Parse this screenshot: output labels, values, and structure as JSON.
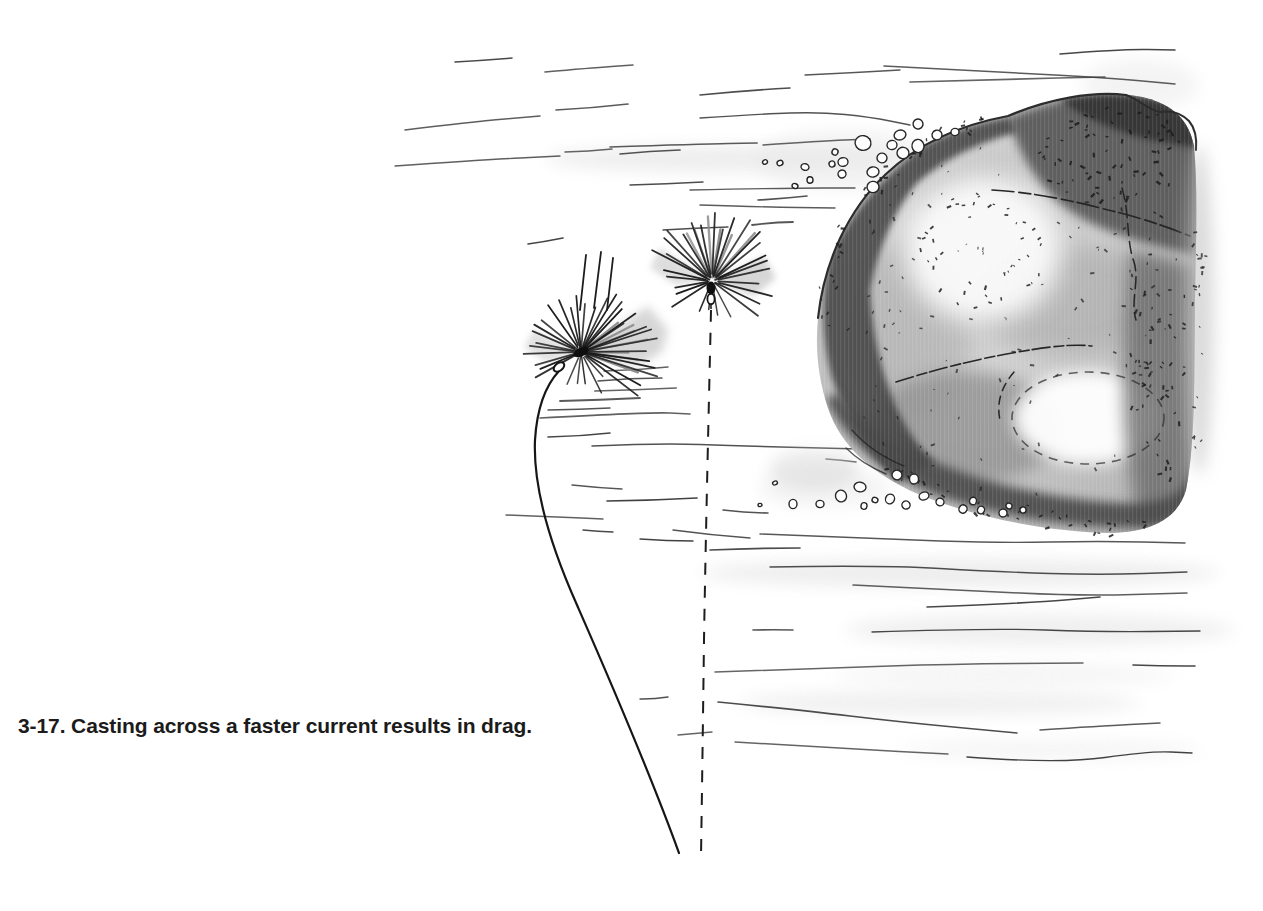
{
  "figure": {
    "number": "3-17",
    "caption": "3-17. Casting across a faster current results in drag."
  },
  "colors": {
    "paper": "#ffffff",
    "ink": "#2b2b2b",
    "rock_midtone": "#9a9a9a",
    "rock_dark": "#3e3e3e",
    "wash": "#e9e9e9"
  },
  "elements": {
    "rock": "midstream-boulder",
    "flies": [
      "dry-fly-left",
      "dry-fly-right"
    ],
    "fly_line": "curved-fly-line",
    "drift_path": "dashed-drift-line",
    "water": "current-lines-and-bubbles"
  }
}
